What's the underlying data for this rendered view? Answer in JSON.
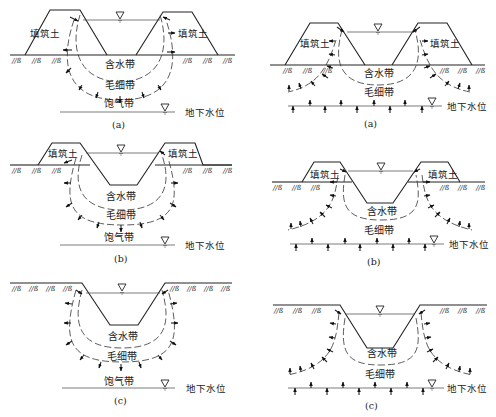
{
  "figure": {
    "left_column": {
      "description": "地下水位较深（自由渗漏）",
      "panels": [
        {
          "id": "a",
          "caption": "(a)",
          "type": "填方渠道",
          "labels": {
            "fill_left": "填筑土",
            "fill_right": "填筑土",
            "zone1": "含水带",
            "zone2": "毛细带",
            "zone3": "饱气带",
            "water_table": "地下水位"
          }
        },
        {
          "id": "b",
          "caption": "(b)",
          "type": "半挖半填渠道",
          "labels": {
            "fill_left": "填筑土",
            "fill_right": "填筑土",
            "zone1": "含水带",
            "zone2": "毛细带",
            "zone3": "饱气带",
            "water_table": "地下水位"
          }
        },
        {
          "id": "c",
          "caption": "(c)",
          "type": "挖方渠道",
          "labels": {
            "zone1": "含水带",
            "zone2": "毛细带",
            "zone3": "饱气带",
            "water_table": "地下水位"
          }
        }
      ]
    },
    "right_column": {
      "description": "地下水位较浅（顶托渗漏）",
      "panels": [
        {
          "id": "a",
          "caption": "(a)",
          "type": "填方渠道",
          "labels": {
            "fill_left": "填筑土",
            "fill_right": "填筑土",
            "zone1": "含水带",
            "zone2": "毛细带",
            "water_table": "地下水位"
          }
        },
        {
          "id": "b",
          "caption": "(b)",
          "type": "半挖半填渠道",
          "labels": {
            "fill_left": "填筑土",
            "fill_right": "填筑土",
            "zone1": "含水带",
            "zone2": "毛细带",
            "water_table": "地下水位"
          }
        },
        {
          "id": "c",
          "caption": "(c)",
          "type": "挖方渠道",
          "labels": {
            "zone1": "含水带",
            "zone2": "毛细带",
            "water_table": "地下水位"
          }
        }
      ]
    },
    "symbols": {
      "water_level": "inverted-triangle",
      "ground_hatch": "///≈",
      "seepage_arrow": "arrow"
    }
  }
}
